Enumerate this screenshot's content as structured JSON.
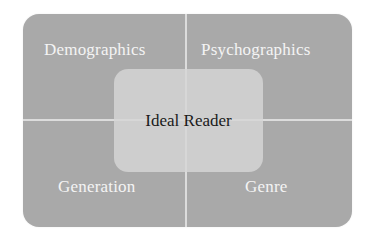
{
  "diagram": {
    "type": "quadrant-with-center",
    "quadrants": [
      {
        "position": "top-left",
        "label": "Demographics"
      },
      {
        "position": "top-right",
        "label": "Psychographics"
      },
      {
        "position": "bottom-left",
        "label": "Generation"
      },
      {
        "position": "bottom-right",
        "label": "Genre"
      }
    ],
    "center": {
      "label": "Ideal Reader"
    },
    "colors": {
      "quadrant_fill": "#a9a9a9",
      "divider": "#dcdcdc",
      "center_fill": "#d2d2d2",
      "quadrant_text": "#f4f4f4",
      "center_text": "#1a1a1a"
    }
  }
}
